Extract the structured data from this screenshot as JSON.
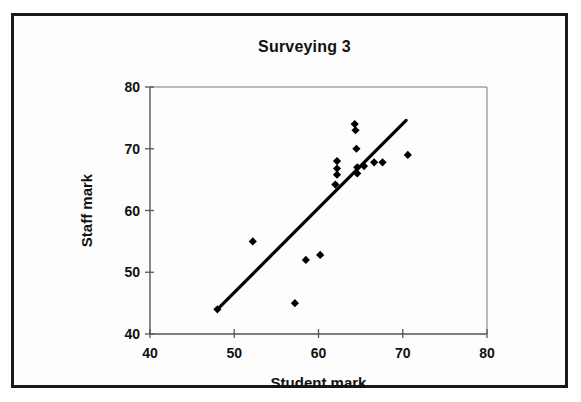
{
  "chart_data": {
    "type": "scatter",
    "title": "Surveying 3",
    "xlabel": "Student mark",
    "ylabel": "Staff mark",
    "xlim": [
      40,
      80
    ],
    "ylim": [
      40,
      80
    ],
    "xticks": [
      40,
      50,
      60,
      70,
      80
    ],
    "yticks": [
      40,
      50,
      60,
      70,
      80
    ],
    "grid": false,
    "legend": false,
    "marker": "filled-diamond",
    "marker_color": "#000000",
    "series": [
      {
        "name": "Staff mark vs Student mark",
        "points": [
          [
            48.0,
            44.0
          ],
          [
            52.2,
            55.0
          ],
          [
            57.2,
            45.0
          ],
          [
            58.5,
            52.0
          ],
          [
            60.2,
            52.8
          ],
          [
            62.0,
            64.2
          ],
          [
            62.2,
            68.0
          ],
          [
            62.2,
            66.8
          ],
          [
            62.2,
            65.8
          ],
          [
            64.3,
            74.0
          ],
          [
            64.4,
            73.0
          ],
          [
            64.5,
            70.0
          ],
          [
            64.6,
            67.0
          ],
          [
            64.6,
            66.0
          ],
          [
            65.4,
            67.2
          ],
          [
            66.6,
            67.8
          ],
          [
            67.6,
            67.8
          ],
          [
            70.6,
            69.0
          ]
        ]
      }
    ],
    "trendline": {
      "name": "linear-fit",
      "x_start": 48.0,
      "y_start": 44.0,
      "x_end": 70.4,
      "y_end": 74.6,
      "color": "#000000"
    }
  }
}
